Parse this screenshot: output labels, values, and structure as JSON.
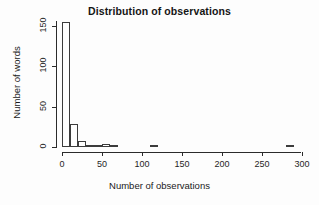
{
  "chart_data": {
    "type": "bar",
    "title": "Distribution of observations",
    "xlabel": "Number of observations",
    "ylabel": "Number of words",
    "xlim": [
      0,
      300
    ],
    "ylim": [
      0,
      160
    ],
    "grid": false,
    "legend": null,
    "bin_width": 10,
    "x_ticks": [
      0,
      50,
      100,
      150,
      200,
      250,
      300
    ],
    "y_ticks": [
      0,
      50,
      100,
      150
    ],
    "x_tick_labels": [
      "0",
      "50",
      "100",
      "150",
      "200",
      "250",
      "300"
    ],
    "y_tick_labels": [
      "0",
      "50",
      "100",
      "150"
    ],
    "bins": [
      {
        "start": 0,
        "end": 10,
        "value": 155
      },
      {
        "start": 10,
        "end": 20,
        "value": 28
      },
      {
        "start": 20,
        "end": 30,
        "value": 8
      },
      {
        "start": 30,
        "end": 40,
        "value": 3
      },
      {
        "start": 40,
        "end": 50,
        "value": 3
      },
      {
        "start": 50,
        "end": 60,
        "value": 4
      },
      {
        "start": 60,
        "end": 70,
        "value": 2
      },
      {
        "start": 70,
        "end": 80,
        "value": 0
      },
      {
        "start": 80,
        "end": 90,
        "value": 0
      },
      {
        "start": 90,
        "end": 100,
        "value": 0
      },
      {
        "start": 100,
        "end": 110,
        "value": 0
      },
      {
        "start": 110,
        "end": 120,
        "value": 2
      },
      {
        "start": 120,
        "end": 130,
        "value": 0
      },
      {
        "start": 130,
        "end": 140,
        "value": 0
      },
      {
        "start": 140,
        "end": 150,
        "value": 0
      },
      {
        "start": 150,
        "end": 160,
        "value": 0
      },
      {
        "start": 160,
        "end": 170,
        "value": 0
      },
      {
        "start": 170,
        "end": 180,
        "value": 0
      },
      {
        "start": 180,
        "end": 190,
        "value": 0
      },
      {
        "start": 190,
        "end": 200,
        "value": 0
      },
      {
        "start": 200,
        "end": 210,
        "value": 0
      },
      {
        "start": 210,
        "end": 220,
        "value": 0
      },
      {
        "start": 220,
        "end": 230,
        "value": 0
      },
      {
        "start": 230,
        "end": 240,
        "value": 0
      },
      {
        "start": 240,
        "end": 250,
        "value": 0
      },
      {
        "start": 250,
        "end": 260,
        "value": 0
      },
      {
        "start": 260,
        "end": 270,
        "value": 0
      },
      {
        "start": 270,
        "end": 280,
        "value": 0
      },
      {
        "start": 280,
        "end": 290,
        "value": 2
      },
      {
        "start": 290,
        "end": 300,
        "value": 0
      }
    ],
    "colors": {
      "bar_fill": "#ffffff",
      "bar_border": "#3c3c3c",
      "axis": "#2b2b2b",
      "text": "#1a1a1a",
      "background": "#fdfdfd"
    }
  }
}
